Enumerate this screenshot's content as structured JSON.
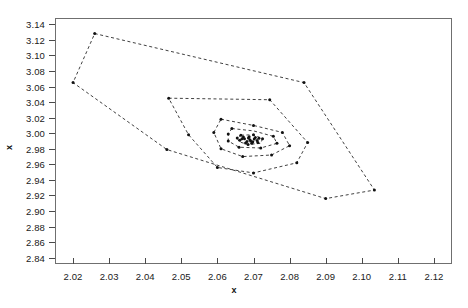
{
  "chart": {
    "type": "scatter",
    "title": "",
    "xlabel": "x",
    "ylabel": "x",
    "x_ticks": [
      "2.02",
      "2.03",
      "2.04",
      "2.05",
      "2.06",
      "2.07",
      "2.08",
      "2.09",
      "2.10",
      "2.11",
      "2.12"
    ],
    "y_ticks": [
      "2.84",
      "2.86",
      "2.88",
      "2.90",
      "2.92",
      "2.94",
      "2.96",
      "2.98",
      "3.00",
      "3.02",
      "3.04",
      "3.06",
      "3.08",
      "3.10",
      "3.12",
      "3.14"
    ],
    "colors": {
      "line": "#2b2b2b",
      "point": "#111111",
      "frame": "#6f6f6f",
      "text": "#1a1a1a"
    }
  },
  "chart_data": {
    "type": "scatter",
    "title": "",
    "xlabel": "x",
    "ylabel": "x",
    "xlim": [
      2.015,
      2.125
    ],
    "ylim": [
      2.832,
      3.148
    ],
    "xticks": [
      2.02,
      2.03,
      2.04,
      2.05,
      2.06,
      2.07,
      2.08,
      2.09,
      2.1,
      2.11,
      2.12
    ],
    "yticks": [
      2.84,
      2.86,
      2.88,
      2.9,
      2.92,
      2.94,
      2.96,
      2.98,
      3.0,
      3.02,
      3.04,
      3.06,
      3.08,
      3.1,
      3.12,
      3.14
    ],
    "grid": false,
    "legend": null,
    "linestyle": "dashed",
    "marker": "point",
    "series": [
      {
        "name": "hull-1-outer",
        "closed": true,
        "points": [
          [
            2.026,
            3.128
          ],
          [
            2.084,
            3.065
          ],
          [
            2.1035,
            2.927
          ],
          [
            2.09,
            2.916
          ],
          [
            2.046,
            2.979
          ],
          [
            2.02,
            3.065
          ]
        ]
      },
      {
        "name": "hull-2",
        "closed": true,
        "points": [
          [
            2.0465,
            3.045
          ],
          [
            2.0745,
            3.043
          ],
          [
            2.085,
            2.988
          ],
          [
            2.082,
            2.962
          ],
          [
            2.07,
            2.949
          ],
          [
            2.06,
            2.956
          ],
          [
            2.052,
            2.998
          ]
        ]
      },
      {
        "name": "hull-3",
        "closed": true,
        "points": [
          [
            2.061,
            3.018
          ],
          [
            2.07,
            3.01
          ],
          [
            2.078,
            3.001
          ],
          [
            2.08,
            2.984
          ],
          [
            2.075,
            2.972
          ],
          [
            2.067,
            2.97
          ],
          [
            2.061,
            2.98
          ],
          [
            2.059,
            3.001
          ]
        ]
      },
      {
        "name": "hull-4",
        "closed": true,
        "points": [
          [
            2.064,
            3.006
          ],
          [
            2.07,
            3.003
          ],
          [
            2.0755,
            2.996
          ],
          [
            2.0765,
            2.987
          ],
          [
            2.072,
            2.981
          ],
          [
            2.066,
            2.982
          ],
          [
            2.063,
            2.99
          ],
          [
            2.063,
            2.999
          ]
        ]
      },
      {
        "name": "hull-5-inner",
        "closed": true,
        "points": [
          [
            2.0665,
            2.9975
          ],
          [
            2.07,
            2.998
          ],
          [
            2.0725,
            2.993
          ],
          [
            2.072,
            2.987
          ],
          [
            2.0685,
            2.9855
          ],
          [
            2.066,
            2.989
          ],
          [
            2.0655,
            2.994
          ]
        ]
      },
      {
        "name": "scatter-points",
        "closed": false,
        "points": [
          [
            2.026,
            3.128
          ],
          [
            2.02,
            3.065
          ],
          [
            2.084,
            3.065
          ],
          [
            2.1035,
            2.927
          ],
          [
            2.09,
            2.916
          ],
          [
            2.046,
            2.979
          ],
          [
            2.0465,
            3.045
          ],
          [
            2.0745,
            3.043
          ],
          [
            2.085,
            2.988
          ],
          [
            2.082,
            2.962
          ],
          [
            2.07,
            2.949
          ],
          [
            2.06,
            2.956
          ],
          [
            2.052,
            2.998
          ],
          [
            2.061,
            3.018
          ],
          [
            2.07,
            3.01
          ],
          [
            2.078,
            3.001
          ],
          [
            2.08,
            2.984
          ],
          [
            2.075,
            2.972
          ],
          [
            2.067,
            2.97
          ],
          [
            2.061,
            2.98
          ],
          [
            2.059,
            3.001
          ],
          [
            2.064,
            3.006
          ],
          [
            2.0755,
            2.996
          ],
          [
            2.0765,
            2.987
          ],
          [
            2.072,
            2.981
          ],
          [
            2.066,
            2.982
          ],
          [
            2.063,
            2.99
          ],
          [
            2.063,
            2.999
          ],
          [
            2.0665,
            2.9975
          ],
          [
            2.07,
            2.998
          ],
          [
            2.0725,
            2.993
          ],
          [
            2.0685,
            2.9855
          ],
          [
            2.0655,
            2.994
          ],
          [
            2.0675,
            2.993
          ],
          [
            2.069,
            2.9915
          ],
          [
            2.0682,
            2.9895
          ],
          [
            2.0698,
            2.989
          ],
          [
            2.071,
            2.9905
          ],
          [
            2.0672,
            2.995
          ],
          [
            2.0688,
            2.9955
          ],
          [
            2.0705,
            2.9945
          ],
          [
            2.0662,
            2.991
          ],
          [
            2.0678,
            2.9875
          ],
          [
            2.0695,
            2.987
          ],
          [
            2.0712,
            2.988
          ],
          [
            2.0668,
            2.993
          ],
          [
            2.0702,
            2.9925
          ],
          [
            2.0715,
            2.9935
          ],
          [
            2.0686,
            2.994
          ],
          [
            2.0692,
            2.99
          ]
        ]
      }
    ]
  }
}
